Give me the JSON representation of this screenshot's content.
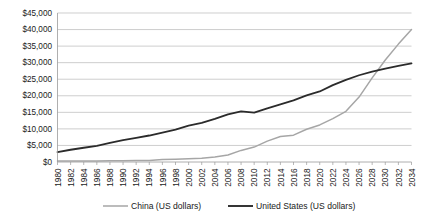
{
  "chart_data": {
    "type": "line",
    "title": "",
    "subtitle": "",
    "xlabel": "",
    "ylabel": "",
    "grid": true,
    "legend_position": "bottom",
    "ylim": [
      0,
      45000
    ],
    "y_ticks": [
      0,
      5000,
      10000,
      15000,
      20000,
      25000,
      30000,
      35000,
      40000,
      45000
    ],
    "y_tick_labels": [
      "$0",
      "$5,000",
      "$10,000",
      "$15,000",
      "$20,000",
      "$25,000",
      "$30,000",
      "$35,000",
      "$40,000",
      "$45,000"
    ],
    "x": [
      1980,
      1982,
      1984,
      1986,
      1988,
      1990,
      1992,
      1994,
      1996,
      1998,
      2000,
      2002,
      2004,
      2006,
      2008,
      2010,
      2012,
      2014,
      2016,
      2018,
      2020,
      2022,
      2024,
      2026,
      2028,
      2030,
      2032,
      2034
    ],
    "x_tick_labels": [
      "1980",
      "1982",
      "1984",
      "1986",
      "1988",
      "1990",
      "1992",
      "1994",
      "1996",
      "1998",
      "2000",
      "2002",
      "2004",
      "2006",
      "2008",
      "2010",
      "2012",
      "2014",
      "2016",
      "2018",
      "2020",
      "2022",
      "2024",
      "2026",
      "2028",
      "2030",
      "2032",
      "2034"
    ],
    "series": [
      {
        "name": "China (US dollars)",
        "color": "#a6a6a6",
        "values": [
          310,
          290,
          320,
          300,
          400,
          360,
          430,
          490,
          730,
          850,
          960,
          1160,
          1520,
          2110,
          3500,
          4500,
          6300,
          7700,
          8100,
          9900,
          11200,
          13100,
          15300,
          19600,
          25400,
          30800,
          35600,
          40000
        ]
      },
      {
        "name": "United States (US dollars)",
        "color": "#2b2b2b",
        "values": [
          3000,
          3700,
          4300,
          4900,
          5800,
          6600,
          7300,
          8000,
          8900,
          9800,
          11000,
          11800,
          13000,
          14400,
          15300,
          14900,
          16200,
          17400,
          18600,
          20100,
          21300,
          23200,
          24800,
          26200,
          27300,
          28200,
          29000,
          29800
        ]
      }
    ]
  },
  "legend": {
    "items": [
      {
        "label": "China (US dollars)",
        "color": "#a6a6a6"
      },
      {
        "label": "United States (US dollars)",
        "color": "#2b2b2b"
      }
    ]
  }
}
